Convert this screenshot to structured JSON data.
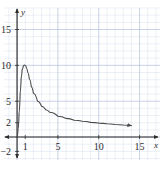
{
  "figure": {
    "background_color": "#ffffff",
    "grid_minor_color": "#cfd9e8",
    "grid_major_color": "#b6c4da",
    "axis_color": "#2b2b2b",
    "curve_color": "#4a4a4a"
  },
  "chart_data": {
    "type": "line",
    "title": "",
    "xlabel": "x",
    "ylabel": "y",
    "xlim": [
      -1.6,
      17.5
    ],
    "ylim": [
      -3.2,
      18.0
    ],
    "grid": true,
    "grid_minor_step": 1,
    "grid_major_step": 5,
    "legend": "none",
    "xticks": [
      1,
      5,
      10,
      15
    ],
    "xtick_labels": [
      "1",
      "5",
      "10",
      "15"
    ],
    "yticks": [
      -2,
      2,
      5,
      10,
      15
    ],
    "ytick_labels": [
      "−2",
      "2",
      "5",
      "10",
      "15"
    ],
    "axis_arrows": [
      "x-right",
      "y-up",
      "y-down",
      "x-left"
    ],
    "series": [
      {
        "name": "curve",
        "arrow_end": "right",
        "x": [
          0.0,
          0.12,
          0.25,
          0.38,
          0.5,
          0.62,
          0.75,
          0.88,
          1.0,
          1.15,
          1.3,
          1.5,
          1.75,
          2.0,
          2.5,
          3.0,
          3.5,
          4.0,
          5.0,
          6.0,
          7.0,
          8.0,
          9.0,
          10.0,
          11.0,
          12.0,
          13.0,
          14.0
        ],
        "y": [
          0.0,
          1.1,
          3.4,
          6.2,
          8.3,
          9.4,
          9.9,
          10.05,
          10.0,
          9.6,
          9.0,
          8.1,
          7.0,
          6.1,
          5.0,
          4.3,
          3.8,
          3.45,
          2.9,
          2.6,
          2.35,
          2.2,
          2.05,
          1.95,
          1.85,
          1.75,
          1.68,
          1.6
        ]
      }
    ],
    "annotations": {
      "peak_x": 1,
      "peak_y": 10,
      "origin_label": ""
    }
  }
}
